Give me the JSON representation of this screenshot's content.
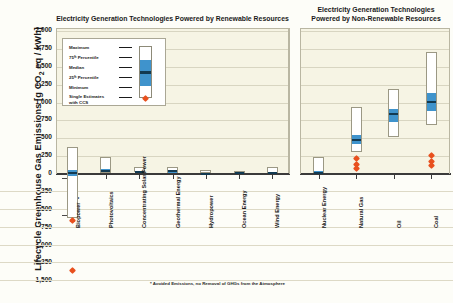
{
  "yaxis": {
    "label_main": "Lifecycle Greenhouse Gas Emissions [g CO",
    "label_sub": "2",
    "label_tail": " eq / kWh]",
    "ticks": [
      "2,000",
      "1,750",
      "1,500",
      "1,250",
      "1,000",
      "750",
      "500",
      "250",
      "0",
      "-250",
      "-500",
      "-750",
      "-1,000",
      "-1,250",
      "-1,500"
    ]
  },
  "panels": {
    "left": {
      "title": "Electricity Generation Technologies Powered by Renewable Resources"
    },
    "right": {
      "title_line1": "Electricity Generation Technologies",
      "title_line2": "Powered by Non-Renewable Resources"
    }
  },
  "legend": {
    "rows": [
      "Maximum",
      "75ᵗʰ Percentile",
      "Median",
      "25ᵗʰ Percentile",
      "Minimum"
    ],
    "ccs_line1": "Single Estimates",
    "ccs_line2": "with CCS"
  },
  "footnote": "* Avoided Emissions, no Removal of GHGs from the Atmosphere",
  "biopower_note": "* *",
  "colors": {
    "iqr": "#3f93cc",
    "median": "#123a52",
    "box_fill": "#ffffff",
    "box_stroke": "#9b9884",
    "ccs_marker": "#e8501e",
    "panel_bg": "#f6f4e4",
    "gridline": "#d8d5c1",
    "axis": "#3a3a3a"
  },
  "chart_data": {
    "type": "box",
    "ylabel": "Lifecycle Greenhouse Gas Emissions [g CO2 eq / kWh]",
    "xlabel": "",
    "ylim": [
      -1500,
      2000
    ],
    "ytick_step": 250,
    "grid": true,
    "legend_position": "inside-top-left",
    "units": "g CO2 eq / kWh",
    "panels": [
      {
        "name": "Electricity Generation Technologies Powered by Renewable Resources",
        "categories": [
          "Biopower",
          "Photovoltaics",
          "Concentrating Solar Power",
          "Geothermal Energy",
          "Hydropower",
          "Ocean Energy",
          "Wind Energy"
        ],
        "boxes": [
          {
            "category": "Biopower",
            "min": -633,
            "q1": -22,
            "median": 18,
            "q3": 62,
            "max": 360,
            "ccs_estimates": [
              -660,
              -1368
            ]
          },
          {
            "category": "Photovoltaics",
            "min": 5,
            "q1": 26,
            "median": 46,
            "q3": 74,
            "max": 217,
            "ccs_estimates": []
          },
          {
            "category": "Concentrating Solar Power",
            "min": 7,
            "q1": 14,
            "median": 22,
            "q3": 32,
            "max": 89,
            "ccs_estimates": []
          },
          {
            "category": "Geothermal Energy",
            "min": 6,
            "q1": 20,
            "median": 45,
            "q3": 57,
            "max": 79,
            "ccs_estimates": []
          },
          {
            "category": "Hydropower",
            "min": 1,
            "q1": 3,
            "median": 4,
            "q3": 7,
            "max": 43,
            "ccs_estimates": []
          },
          {
            "category": "Ocean Energy",
            "min": 2,
            "q1": 6,
            "median": 8,
            "q3": 23,
            "max": 23,
            "ccs_estimates": []
          },
          {
            "category": "Wind Energy",
            "min": 2,
            "q1": 8,
            "median": 12,
            "q3": 20,
            "max": 81,
            "ccs_estimates": []
          }
        ]
      },
      {
        "name": "Electricity Generation Technologies Powered by Non-Renewable Resources",
        "categories": [
          "Nuclear Energy",
          "Natural Gas",
          "Oil",
          "Coal"
        ],
        "boxes": [
          {
            "category": "Nuclear Energy",
            "min": 1,
            "q1": 8,
            "median": 16,
            "q3": 45,
            "max": 220,
            "ccs_estimates": []
          },
          {
            "category": "Natural Gas",
            "min": 290,
            "q1": 422,
            "median": 469,
            "q3": 548,
            "max": 930,
            "ccs_estimates": [
              200,
              120,
              65
            ]
          },
          {
            "category": "Oil",
            "min": 510,
            "q1": 722,
            "median": 840,
            "q3": 907,
            "max": 1170,
            "ccs_estimates": []
          },
          {
            "category": "Coal",
            "min": 675,
            "q1": 877,
            "median": 1001,
            "q3": 1130,
            "max": 1689,
            "ccs_estimates": [
              245,
              160,
              98
            ]
          }
        ]
      }
    ]
  }
}
